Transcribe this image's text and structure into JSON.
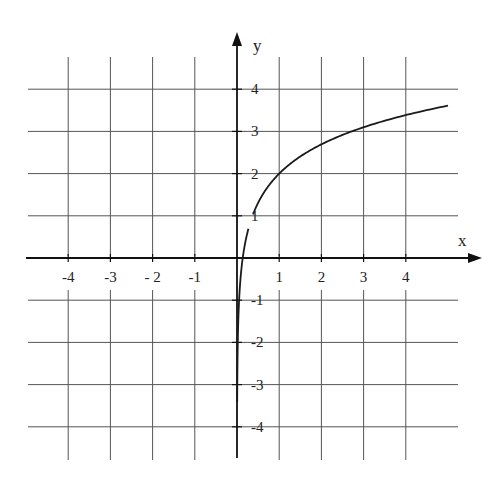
{
  "chart_data": {
    "type": "line",
    "title": "",
    "xlabel": "x",
    "ylabel": "y",
    "xlim": [
      -5,
      5.5
    ],
    "ylim": [
      -4.6,
      4.8
    ],
    "grid": true,
    "x_ticks": [
      -4,
      -3,
      -2,
      -1,
      1,
      2,
      3,
      4
    ],
    "y_ticks": [
      -4,
      -3,
      -2,
      -1,
      1,
      2,
      3,
      4
    ],
    "x_tick_labels": [
      "-4",
      "-3",
      "- 2",
      "-1",
      "1",
      "2",
      "3",
      "4"
    ],
    "y_tick_labels": [
      "-4",
      "-3",
      "-2",
      "-1",
      "1",
      "2",
      "3",
      "4"
    ],
    "series": [
      {
        "name": "y = 2 + ln x",
        "x": [
          0.01,
          0.05,
          0.1,
          0.2,
          0.3,
          0.5,
          0.75,
          1,
          1.5,
          2,
          2.5,
          3,
          3.5,
          4,
          4.5,
          5
        ],
        "values": [
          -2.61,
          -1.0,
          -0.3,
          0.39,
          0.8,
          1.31,
          1.71,
          2.0,
          2.41,
          2.69,
          2.92,
          3.1,
          3.25,
          3.39,
          3.5,
          3.61
        ]
      }
    ],
    "colors": {
      "curve": "#1a1a1a",
      "grid": "#444444",
      "axis": "#111111"
    }
  }
}
